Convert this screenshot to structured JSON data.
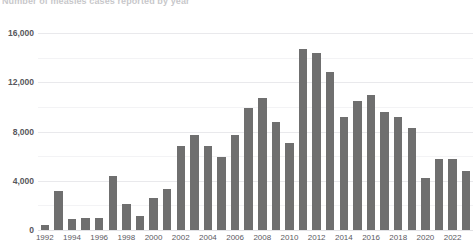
{
  "title": {
    "text": "Number of measles cases reported by year",
    "right_note": ""
  },
  "chart_data": {
    "type": "bar",
    "title": "Number of measles cases reported by year",
    "xlabel": "",
    "ylabel": "",
    "ylim": [
      0,
      16000
    ],
    "yticks": [
      0,
      4000,
      8000,
      12000,
      16000
    ],
    "ytick_labels": [
      "0",
      "4,000",
      "8,000",
      "12,000",
      "16,000"
    ],
    "grid": true,
    "legend": "none",
    "bar_color": "#6f6f6f",
    "gridline_color": "#e9e9ec",
    "categories": [
      "1992",
      "1993",
      "1994",
      "1995",
      "1996",
      "1997",
      "1998",
      "1999",
      "2000",
      "2001",
      "2002",
      "2003",
      "2004",
      "2005",
      "2006",
      "2007",
      "2008",
      "2009",
      "2010",
      "2011",
      "2012",
      "2013",
      "2014",
      "2015",
      "2016",
      "2017",
      "2018",
      "2019",
      "2020",
      "2021",
      "2022",
      "2023"
    ],
    "xtick_labels": [
      "1992",
      "1994",
      "1996",
      "1998",
      "2000",
      "2002",
      "2004",
      "2006",
      "2008",
      "2010",
      "2012",
      "2014",
      "2016",
      "2018",
      "2020",
      "2022"
    ],
    "values": [
      400,
      3200,
      900,
      1000,
      1000,
      4400,
      2100,
      1100,
      2600,
      3300,
      6800,
      7700,
      6800,
      5900,
      7700,
      9900,
      10700,
      8800,
      7100,
      14700,
      14400,
      12800,
      9200,
      10500,
      11000,
      9600,
      9200,
      8300,
      4200,
      5800,
      5800,
      4800
    ]
  }
}
